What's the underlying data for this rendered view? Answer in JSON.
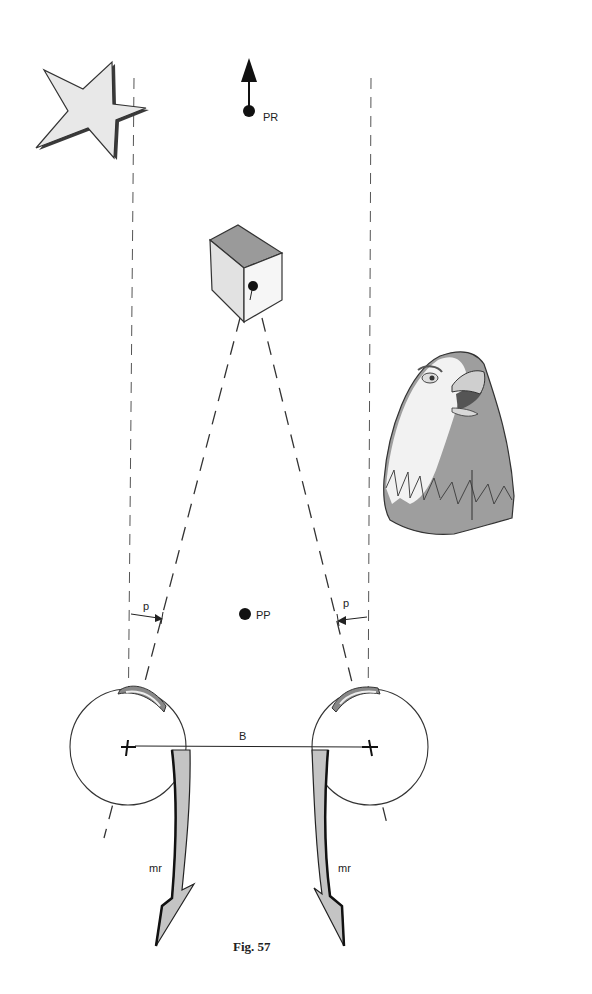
{
  "figure": {
    "caption": "Fig. 57",
    "labels": {
      "far_point": "PR",
      "near_point": "PP",
      "left_angle": "p",
      "right_angle": "p",
      "baseline": "B",
      "left_muscle": "mr",
      "right_muscle": "mr"
    },
    "objects": [
      "star",
      "cube",
      "eagle-head",
      "left-eye",
      "right-eye"
    ],
    "colors": {
      "outline": "#222222",
      "light_fill": "#e6e6e6",
      "mid_fill": "#a8a8a8",
      "dark_fill": "#8c8c8c",
      "background": "#ffffff"
    }
  }
}
